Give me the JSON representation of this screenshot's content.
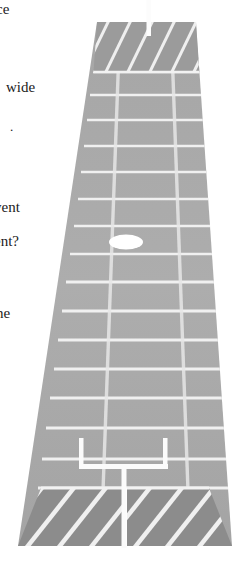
{
  "page": {
    "background_color": "#ffffff",
    "width": 247,
    "height": 567
  },
  "margin_text": {
    "fragments": [
      {
        "id": "frag-0",
        "text": "ce",
        "top": 2,
        "left": -4
      },
      {
        "id": "frag-1",
        "text": "wide",
        "top": 80,
        "left": 6
      },
      {
        "id": "frag-2",
        "text": ".",
        "top": 119,
        "left": 10
      },
      {
        "id": "frag-3",
        "text": "vent",
        "top": 200,
        "left": -6
      },
      {
        "id": "frag-4",
        "text": "ent?",
        "top": 234,
        "left": -6
      },
      {
        "id": "frag-5",
        "text": "ne",
        "top": 306,
        "left": -4
      }
    ]
  },
  "illustration": {
    "title": "american-football-field-perspective",
    "colors": {
      "field_light": "#a9a9a9",
      "field_mid": "#a2a2a2",
      "endzone_far": "#9a9a9a",
      "endzone_near": "#8b8b8b",
      "line_white": "#f2f2f2",
      "line_soft": "#e3e3e3",
      "ball_white": "#ffffff",
      "goalpost_white": "#fbfbfb",
      "page_background": "#ffffff"
    },
    "geometry": {
      "near_left_x": 18,
      "near_right_x": 232,
      "near_y": 546,
      "far_left_x": 97,
      "far_right_x": 196,
      "far_y": 22,
      "endzone_far_bottom_y": 72,
      "endzone_near_top_y": 488
    },
    "yard_lines_count": 19,
    "hash_lines_count": 2,
    "endzone_stripes_far": 5,
    "endzone_stripes_near": 4,
    "ball": {
      "cx": 126,
      "cy": 242,
      "rx": 17,
      "ry": 7.5,
      "label": "football"
    },
    "goalpost_near": {
      "crossbar_y": 466,
      "crossbar_left_x": 80,
      "crossbar_right_x": 167,
      "upright_top_y": 438,
      "post_x": 124,
      "post_bottom_y": 546,
      "label": "near-goalpost"
    },
    "goalpost_far": {
      "post_x": 149,
      "post_top_y": 0,
      "post_bottom_y": 36,
      "label": "far-goalpost"
    }
  }
}
